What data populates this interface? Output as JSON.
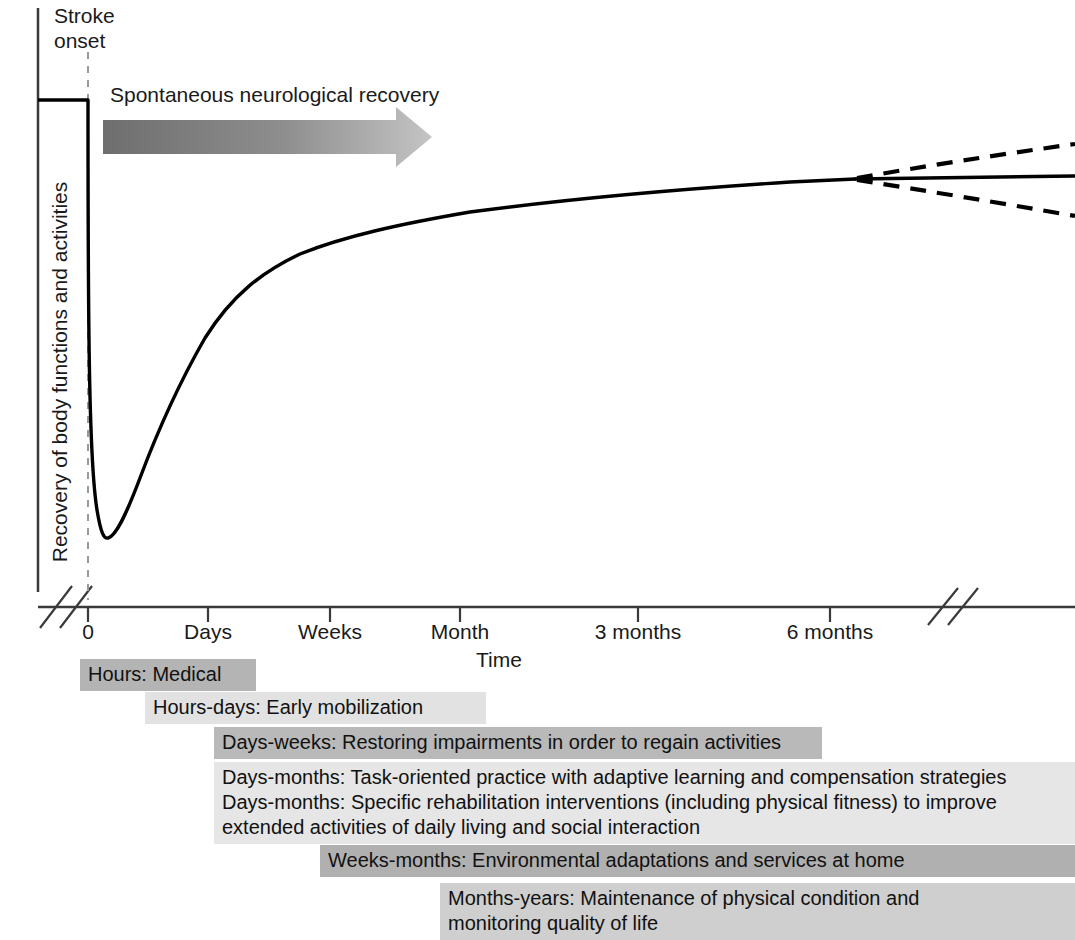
{
  "figure": {
    "type": "line",
    "background": "#ffffff",
    "ink_color": "#000000"
  },
  "annotations": {
    "stroke_onset": "Stroke\nonset",
    "spontaneous_recovery": "Spontaneous neurological recovery",
    "arrow": {
      "name": "spontaneous-recovery-arrow",
      "dark_color": "#6e6e6e",
      "light_color": "#c0c0c0"
    }
  },
  "axes": {
    "y_title": "Recovery of body functions and activities",
    "x_title": "Time",
    "x_ticks": [
      {
        "label": "0",
        "x": 88
      },
      {
        "label": "Days",
        "x": 208
      },
      {
        "label": "Weeks",
        "x": 330
      },
      {
        "label": "Month",
        "x": 460
      },
      {
        "label": "3 months",
        "x": 638
      },
      {
        "label": "6 months",
        "x": 830
      }
    ],
    "has_x_axis_break_left": true,
    "has_x_axis_break_right": true,
    "has_y_axis_break": true
  },
  "chart_data": {
    "type": "line",
    "title": "",
    "xlabel": "Time",
    "ylabel": "Recovery of body functions and activities",
    "xlim": [
      0,
      1075
    ],
    "ylim": [
      0,
      600
    ],
    "grid": false,
    "legend": "none",
    "x_tick_labels": [
      "0",
      "Days",
      "Weeks",
      "Month",
      "3 months",
      "6 months"
    ],
    "series": [
      {
        "name": "Recovery curve (observed)",
        "style": "solid",
        "points": [
          {
            "x": 38,
            "y": 100
          },
          {
            "x": 87,
            "y": 100
          },
          {
            "x": 88,
            "y": 380
          },
          {
            "x": 93,
            "y": 470
          },
          {
            "x": 100,
            "y": 525
          },
          {
            "x": 107,
            "y": 538
          },
          {
            "x": 118,
            "y": 528
          },
          {
            "x": 135,
            "y": 488
          },
          {
            "x": 160,
            "y": 425
          },
          {
            "x": 190,
            "y": 360
          },
          {
            "x": 225,
            "y": 305
          },
          {
            "x": 265,
            "y": 270
          },
          {
            "x": 310,
            "y": 248
          },
          {
            "x": 370,
            "y": 230
          },
          {
            "x": 440,
            "y": 216
          },
          {
            "x": 520,
            "y": 205
          },
          {
            "x": 610,
            "y": 196
          },
          {
            "x": 700,
            "y": 189
          },
          {
            "x": 790,
            "y": 183
          },
          {
            "x": 855,
            "y": 179
          }
        ]
      },
      {
        "name": "Plateau (projected, stable)",
        "style": "solid",
        "points": [
          {
            "x": 855,
            "y": 179
          },
          {
            "x": 1075,
            "y": 176
          }
        ]
      },
      {
        "name": "Further improvement (projected)",
        "style": "dashed",
        "points": [
          {
            "x": 855,
            "y": 179
          },
          {
            "x": 1075,
            "y": 144
          }
        ]
      },
      {
        "name": "Decline (projected)",
        "style": "dashed",
        "points": [
          {
            "x": 855,
            "y": 179
          },
          {
            "x": 1075,
            "y": 216
          }
        ]
      }
    ],
    "annotations": [
      {
        "text": "Stroke onset",
        "x": 88,
        "y": 20,
        "marker": "dashed-vertical-line"
      },
      {
        "text": "Spontaneous neurological recovery",
        "x": 110,
        "y": 95,
        "marker": "gradient-arrow"
      }
    ],
    "timeline_bars": [
      {
        "label": "Hours: Medical",
        "start": 80,
        "end": 256,
        "shade": "#b4b4b4",
        "lines": 1
      },
      {
        "label": "Hours-days: Early mobilization",
        "start": 145,
        "end": 486,
        "shade": "#e2e2e2",
        "lines": 1
      },
      {
        "label": "Days-weeks: Restoring impairments in order to regain activities",
        "start": 214,
        "end": 822,
        "shade": "#b9b9b9",
        "lines": 1
      },
      {
        "label": "Days-months: Task-oriented practice with adaptive learning and compensation strategies\nDays-months: Specific rehabilitation interventions (including physical fitness) to improve\nextended activities of daily living and social interaction",
        "start": 214,
        "end": 1075,
        "shade": "#e6e6e6",
        "lines": 3
      },
      {
        "label": "Weeks-months: Environmental adaptations and services at home",
        "start": 320,
        "end": 1075,
        "shade": "#b0b0b0",
        "lines": 1
      },
      {
        "label": "Months-years: Maintenance of physical condition and\nmonitoring quality of life",
        "start": 440,
        "end": 1075,
        "shade": "#cfcfcf",
        "lines": 2
      }
    ]
  },
  "timeline": {
    "bars": [
      {
        "text": "Hours: Medical"
      },
      {
        "text": "Hours-days: Early mobilization"
      },
      {
        "text": "Days-weeks: Restoring impairments in order to regain activities"
      },
      {
        "text": "Days-months: Task-oriented practice with adaptive learning and compensation strategies\nDays-months: Specific rehabilitation interventions (including physical fitness) to improve\nextended activities of daily living and social interaction"
      },
      {
        "text": "Weeks-months: Environmental adaptations and services at home"
      },
      {
        "text": "Months-years: Maintenance of physical condition and\nmonitoring quality of life"
      }
    ]
  }
}
